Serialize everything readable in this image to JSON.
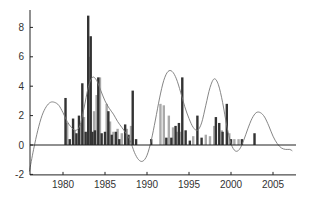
{
  "chart_data": {
    "type": "bar",
    "title": "",
    "xlabel": "",
    "ylabel": "",
    "xlim": [
      1975.8,
      2007.5
    ],
    "ylim": [
      -2,
      9.5
    ],
    "grid": false,
    "legend": null,
    "x_ticks": [
      1980,
      1985,
      1990,
      1995,
      2000,
      2005
    ],
    "x_tick_labels": [
      "1980",
      "1985",
      "1990",
      "1995",
      "2000",
      "2005"
    ],
    "y_ticks": [
      -2,
      0,
      2,
      4,
      6,
      8
    ],
    "y_tick_labels": [
      "-2",
      "0",
      "2",
      "4",
      "6",
      "8"
    ],
    "colors": {
      "dark_bar": "#333333",
      "light_bar": "#aaaaaa",
      "curve": "#777777",
      "axis": "#222222"
    },
    "series": [
      {
        "name": "dark bars",
        "type": "bar",
        "x": [
          1980.3,
          1980.8,
          1981.2,
          1981.6,
          1981.9,
          1982.3,
          1982.7,
          1983.0,
          1983.3,
          1983.5,
          1983.8,
          1984.2,
          1984.6,
          1985.0,
          1985.4,
          1985.8,
          1986.3,
          1986.7,
          1987.4,
          1987.8,
          1988.3,
          1988.7,
          1990.5,
          1992.3,
          1992.9,
          1993.4,
          1993.8,
          1994.2,
          1994.6,
          1995.1,
          1996.0,
          1996.5,
          1998.2,
          1998.6,
          1999.0,
          1999.5,
          2000.0,
          2001.3,
          2002.8
        ],
        "values": [
          3.2,
          0.4,
          1.8,
          0.8,
          2.0,
          4.2,
          0.9,
          8.8,
          7.4,
          0.9,
          1.0,
          4.6,
          0.8,
          0.9,
          2.3,
          0.7,
          0.9,
          0.4,
          1.4,
          0.7,
          3.7,
          0.4,
          0.4,
          0.5,
          0.5,
          1.3,
          1.5,
          4.6,
          1.0,
          0.3,
          2.0,
          0.5,
          1.9,
          1.5,
          0.9,
          2.8,
          0.4,
          0.4,
          0.8
        ]
      },
      {
        "name": "light bars",
        "type": "bar",
        "x": [
          1980.5,
          1981.4,
          1982.0,
          1982.5,
          1983.2,
          1983.7,
          1984.0,
          1984.4,
          1985.2,
          1985.6,
          1986.0,
          1986.5,
          1987.0,
          1987.6,
          1988.1,
          1991.6,
          1992.0,
          1992.6,
          1993.1,
          1993.6,
          1994.0,
          1995.5,
          1997.0,
          1997.5,
          1998.0,
          1998.9,
          1999.8,
          2000.4,
          2000.9
        ],
        "values": [
          1.5,
          1.0,
          1.4,
          1.9,
          6.0,
          2.3,
          3.4,
          4.6,
          2.8,
          1.6,
          0.9,
          1.1,
          0.8,
          1.1,
          1.3,
          2.8,
          2.7,
          2.0,
          1.2,
          0.9,
          0.9,
          0.6,
          0.7,
          0.6,
          1.3,
          1.0,
          0.8,
          0.4,
          0.4
        ]
      },
      {
        "name": "smoothed curve",
        "type": "line",
        "x": [
          1976.0,
          1976.5,
          1977.0,
          1977.5,
          1978.0,
          1978.5,
          1979.0,
          1979.5,
          1980.0,
          1980.5,
          1981.0,
          1981.5,
          1982.0,
          1982.5,
          1983.0,
          1983.5,
          1984.0,
          1984.5,
          1985.0,
          1985.5,
          1986.0,
          1986.5,
          1987.0,
          1987.5,
          1988.0,
          1988.5,
          1989.0,
          1989.5,
          1990.0,
          1990.5,
          1991.0,
          1991.5,
          1992.0,
          1992.5,
          1993.0,
          1993.5,
          1994.0,
          1994.5,
          1995.0,
          1995.5,
          1996.0,
          1996.5,
          1997.0,
          1997.5,
          1998.0,
          1998.5,
          1999.0,
          1999.5,
          2000.0,
          2000.5,
          2001.0,
          2001.5,
          2002.0,
          2002.5,
          2003.0,
          2003.5,
          2004.0,
          2004.5,
          2005.0,
          2005.5,
          2006.0,
          2006.5,
          2007.0,
          2007.3
        ],
        "values": [
          -1.8,
          -0.3,
          1.0,
          2.0,
          2.6,
          2.9,
          2.9,
          2.7,
          2.2,
          1.6,
          1.2,
          1.0,
          1.3,
          2.5,
          3.9,
          4.6,
          4.4,
          3.7,
          3.0,
          2.5,
          2.1,
          1.6,
          1.2,
          0.8,
          0.3,
          -0.5,
          -1.0,
          -1.1,
          -0.7,
          0.3,
          1.7,
          3.2,
          4.4,
          5.0,
          5.0,
          4.5,
          3.6,
          2.6,
          1.8,
          1.2,
          1.0,
          1.5,
          2.7,
          3.9,
          4.5,
          4.1,
          2.9,
          1.3,
          0.1,
          -0.4,
          -0.3,
          0.3,
          1.1,
          1.8,
          2.2,
          2.2,
          1.9,
          1.3,
          0.6,
          0.1,
          -0.2,
          -0.3,
          -0.3,
          -0.4
        ]
      }
    ]
  }
}
